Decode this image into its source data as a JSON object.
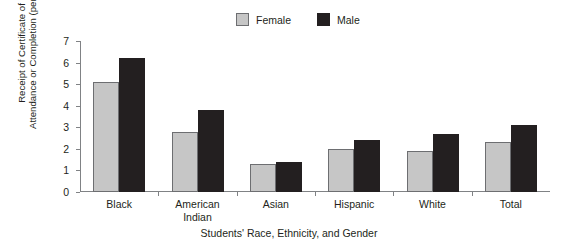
{
  "chart_data": {
    "type": "bar",
    "title": "",
    "categories": [
      "Black",
      "American\nIndian",
      "Asian",
      "Hispanic",
      "White",
      "Total"
    ],
    "series": [
      {
        "name": "Female",
        "values": [
          5.1,
          2.8,
          1.3,
          2.0,
          1.9,
          2.3
        ],
        "color": "#c6c6c6"
      },
      {
        "name": "Male",
        "values": [
          6.2,
          3.8,
          1.4,
          2.4,
          2.7,
          3.1
        ],
        "color": "#231f20"
      }
    ],
    "xlabel": "Students' Race, Ethnicity, and Gender",
    "ylabel": "Receipt of Certificate of Attendance or Completion (percent)",
    "ylabel_line1": "Receipt of Certificate of",
    "ylabel_line2": "Attendance or Completion (percent)",
    "ylim": [
      0,
      7
    ],
    "yticks": [
      0,
      1,
      2,
      3,
      4,
      5,
      6,
      7
    ],
    "ytick_labels": [
      "0",
      "1",
      "2",
      "3",
      "4",
      "5",
      "6",
      "7"
    ],
    "grid": false,
    "legend_position": "top-center"
  },
  "legend": {
    "entries": [
      {
        "label": "Female",
        "swatch": "#c6c6c6"
      },
      {
        "label": "Male",
        "swatch": "#231f20"
      }
    ]
  }
}
